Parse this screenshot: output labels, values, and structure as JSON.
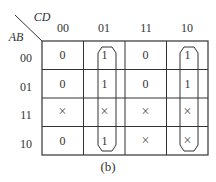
{
  "kmap": {
    "col_var": "CD",
    "row_var": "AB",
    "col_headers": [
      "00",
      "01",
      "11",
      "10"
    ],
    "row_headers": [
      "00",
      "01",
      "11",
      "10"
    ],
    "cells": [
      [
        "0",
        "1",
        "0",
        "1"
      ],
      [
        "0",
        "1",
        "0",
        "1"
      ],
      [
        "×",
        "×",
        "×",
        "×"
      ],
      [
        "0",
        "1",
        "×",
        "×"
      ]
    ],
    "groups": [
      {
        "column": "01",
        "rows": [
          "00",
          "01",
          "11",
          "10"
        ]
      },
      {
        "column": "10",
        "rows": [
          "00",
          "01",
          "11",
          "10"
        ]
      }
    ],
    "caption": "(b)"
  }
}
